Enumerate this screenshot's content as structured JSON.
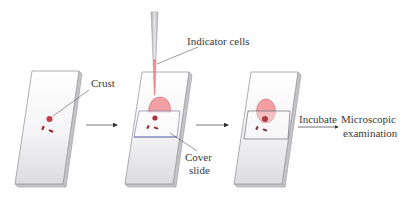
{
  "diagram": {
    "title": "",
    "steps": [
      {
        "id": "step-1",
        "description": "Slide with crust",
        "labels": [
          "Crust"
        ]
      },
      {
        "id": "step-2",
        "description": "Indicator cells added with pipette, cover slide placed",
        "labels": [
          "Indicator cells",
          "Cover",
          "slide"
        ]
      },
      {
        "id": "step-3",
        "description": "Slide with cover slide and indicator cells",
        "labels": []
      }
    ],
    "labels": {
      "crust": "Crust",
      "indicator_cells": "Indicator cells",
      "cover_line1": "Cover",
      "cover_line2": "slide",
      "incubate": "Incubate",
      "result_line1": "Microscopic",
      "result_line2": "examination"
    },
    "colors": {
      "slide_fill": "#f2f2f4",
      "slide_edge": "#9a9aa0",
      "crust": "#c0404a",
      "indicator_cells": "#f0a0a4",
      "cover_slide_edge": "#7070c0",
      "pipette": "#c8c8cc",
      "leader_line": "#555555",
      "text": "#3a3a3a"
    }
  }
}
